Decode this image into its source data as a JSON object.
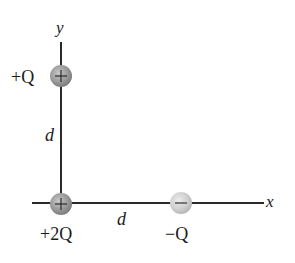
{
  "diagram": {
    "axes": {
      "x_label": "x",
      "y_label": "y"
    },
    "charges": [
      {
        "id": "top",
        "label": "+Q",
        "sign": "+",
        "color": "#9a9a9a"
      },
      {
        "id": "origin",
        "label": "+2Q",
        "sign": "+",
        "color": "#9a9a9a"
      },
      {
        "id": "right",
        "label": "−Q",
        "sign": "−",
        "color": "#cfcfcf"
      }
    ],
    "distances": {
      "vertical": "d",
      "horizontal": "d"
    },
    "colors": {
      "axis": "#2a2a2a",
      "text": "#1a1a1a",
      "positive_charge": "#9a9a9a",
      "negative_charge": "#cfcfcf"
    }
  }
}
